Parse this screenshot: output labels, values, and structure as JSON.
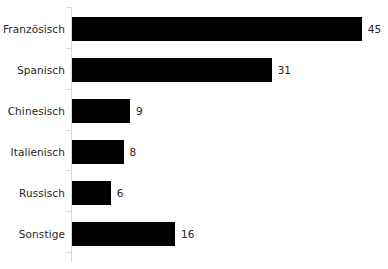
{
  "chart_data": {
    "type": "bar",
    "orientation": "horizontal",
    "title": "",
    "subtitle": "",
    "xlabel": "",
    "ylabel": "",
    "categories": [
      "Französisch",
      "Spanisch",
      "Chinesisch",
      "Italienisch",
      "Russisch",
      "Sonstige"
    ],
    "values": [
      45,
      31,
      9,
      8,
      6,
      16
    ],
    "value_labels": [
      "45",
      "31",
      "9",
      "8",
      "6",
      "16"
    ],
    "xlim": [
      0,
      45
    ],
    "grid": false,
    "legend": null,
    "series": [
      {
        "name": "",
        "values": [
          45,
          31,
          9,
          8,
          6,
          16
        ]
      }
    ],
    "colors": {
      "bar": "#000000",
      "text": "#262626",
      "axis": "#d9d9d9",
      "background": "#ffffff"
    },
    "axis": {
      "y_axis_visible": true,
      "x_axis_visible": false,
      "tick_marks": true
    }
  }
}
